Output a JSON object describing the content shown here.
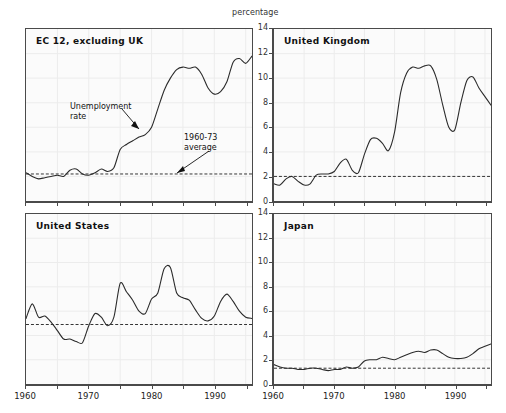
{
  "figure": {
    "unit_label": "percentage",
    "annotations": [
      {
        "id": "unemployment-rate",
        "text": "Unemployment\nrate"
      },
      {
        "id": "average-1960-73",
        "text": "1960-73\naverage"
      }
    ],
    "line_color": "#2b2b2b",
    "average_line_color": "#333333",
    "frame_color": "#4a4a4a",
    "plot_background": "#fbfbfb"
  },
  "chart_data": {
    "type": "line",
    "title": "percentage",
    "xlabel": "",
    "ylabel": "percentage",
    "xlim": [
      1960,
      1996
    ],
    "ylim": [
      0,
      14
    ],
    "yticks": [
      0,
      2,
      4,
      6,
      8,
      10,
      12,
      14
    ],
    "xticks": [
      1960,
      1965,
      1970,
      1975,
      1980,
      1985,
      1990,
      1995
    ],
    "xtick_labels": [
      "1960",
      "",
      "1970",
      "",
      "1980",
      "",
      "1990",
      ""
    ],
    "grid": true,
    "legend": "none",
    "panels": [
      {
        "id": "ec12-excluding-uk",
        "label": "EC 12, excluding UK",
        "position": "top-left",
        "average_1960_73": 2.2,
        "x": [
          1960,
          1961,
          1962,
          1963,
          1964,
          1965,
          1966,
          1967,
          1968,
          1969,
          1970,
          1971,
          1972,
          1973,
          1974,
          1975,
          1976,
          1977,
          1978,
          1979,
          1980,
          1981,
          1982,
          1983,
          1984,
          1985,
          1986,
          1987,
          1988,
          1989,
          1990,
          1991,
          1992,
          1993,
          1994,
          1995,
          1996
        ],
        "y": [
          2.3,
          2.0,
          1.8,
          1.9,
          2.0,
          2.1,
          2.0,
          2.5,
          2.6,
          2.2,
          2.1,
          2.3,
          2.6,
          2.4,
          2.7,
          4.2,
          4.6,
          4.9,
          5.2,
          5.4,
          6.0,
          7.5,
          9.0,
          10.0,
          10.7,
          10.9,
          10.8,
          10.9,
          10.3,
          9.2,
          8.7,
          8.9,
          9.7,
          11.3,
          11.6,
          11.2,
          11.8
        ]
      },
      {
        "id": "united-kingdom",
        "label": "United Kingdom",
        "position": "top-right",
        "average_1960_73": 2.0,
        "x": [
          1960,
          1961,
          1962,
          1963,
          1964,
          1965,
          1966,
          1967,
          1968,
          1969,
          1970,
          1971,
          1972,
          1973,
          1974,
          1975,
          1976,
          1977,
          1978,
          1979,
          1980,
          1981,
          1982,
          1983,
          1984,
          1985,
          1986,
          1987,
          1988,
          1989,
          1990,
          1991,
          1992,
          1993,
          1994,
          1995,
          1996
        ],
        "y": [
          1.4,
          1.3,
          1.8,
          2.0,
          1.6,
          1.3,
          1.4,
          2.1,
          2.2,
          2.2,
          2.4,
          3.1,
          3.4,
          2.5,
          2.3,
          3.8,
          5.0,
          5.1,
          4.7,
          4.1,
          5.6,
          8.8,
          10.4,
          10.9,
          10.8,
          11.0,
          11.0,
          9.9,
          7.8,
          6.0,
          5.8,
          8.0,
          9.8,
          10.1,
          9.2,
          8.5,
          7.8
        ]
      },
      {
        "id": "united-states",
        "label": "United States",
        "position": "bottom-left",
        "average_1960_73": 4.9,
        "x": [
          1960,
          1961,
          1962,
          1963,
          1964,
          1965,
          1966,
          1967,
          1968,
          1969,
          1970,
          1971,
          1972,
          1973,
          1974,
          1975,
          1976,
          1977,
          1978,
          1979,
          1980,
          1981,
          1982,
          1983,
          1984,
          1985,
          1986,
          1987,
          1988,
          1989,
          1990,
          1991,
          1992,
          1993,
          1994,
          1995,
          1996
        ],
        "y": [
          5.4,
          6.6,
          5.5,
          5.6,
          5.1,
          4.4,
          3.7,
          3.7,
          3.5,
          3.4,
          4.8,
          5.8,
          5.5,
          4.8,
          5.5,
          8.3,
          7.6,
          6.9,
          6.0,
          5.8,
          7.0,
          7.5,
          9.5,
          9.6,
          7.5,
          7.1,
          6.9,
          6.1,
          5.4,
          5.2,
          5.6,
          6.8,
          7.4,
          6.8,
          6.0,
          5.5,
          5.4
        ]
      },
      {
        "id": "japan",
        "label": "Japan",
        "position": "bottom-right",
        "average_1960_73": 1.3,
        "x": [
          1960,
          1961,
          1962,
          1963,
          1964,
          1965,
          1966,
          1967,
          1968,
          1969,
          1970,
          1971,
          1972,
          1973,
          1974,
          1975,
          1976,
          1977,
          1978,
          1979,
          1980,
          1981,
          1982,
          1983,
          1984,
          1985,
          1986,
          1987,
          1988,
          1989,
          1990,
          1991,
          1992,
          1993,
          1994,
          1995,
          1996
        ],
        "y": [
          1.6,
          1.4,
          1.3,
          1.3,
          1.2,
          1.2,
          1.3,
          1.3,
          1.2,
          1.1,
          1.2,
          1.2,
          1.4,
          1.3,
          1.4,
          1.9,
          2.0,
          2.0,
          2.2,
          2.1,
          2.0,
          2.2,
          2.4,
          2.6,
          2.7,
          2.6,
          2.8,
          2.8,
          2.5,
          2.2,
          2.1,
          2.1,
          2.2,
          2.5,
          2.9,
          3.1,
          3.3
        ]
      }
    ]
  }
}
